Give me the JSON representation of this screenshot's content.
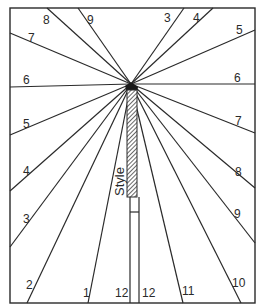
{
  "diagram": {
    "type": "vertical sundial dial face",
    "style_label": "Style",
    "colors": {
      "line": "#2a2a2a",
      "background": "#ffffff"
    },
    "apex": [
      131,
      84
    ],
    "frame": {
      "x": 10,
      "y": 8,
      "w": 245,
      "h": 295
    },
    "hour_lines": [
      {
        "hour": "8",
        "end": [
          47,
          8
        ],
        "label_pos": [
          43,
          24
        ]
      },
      {
        "hour": "9",
        "end": [
          78,
          8
        ],
        "label_pos": [
          87,
          24
        ]
      },
      {
        "hour": "3",
        "end": [
          184,
          8
        ],
        "label_pos": [
          164,
          22
        ]
      },
      {
        "hour": "4",
        "end": [
          213,
          8
        ],
        "label_pos": [
          193,
          22
        ]
      },
      {
        "hour": "7",
        "end": [
          10,
          33
        ],
        "label_pos": [
          28,
          42
        ]
      },
      {
        "hour": "5",
        "end": [
          255,
          30
        ],
        "label_pos": [
          236,
          34
        ]
      },
      {
        "hour": "6",
        "end": [
          10,
          87
        ],
        "label_pos": [
          23,
          84
        ]
      },
      {
        "hour": "6",
        "end": [
          255,
          84
        ],
        "label_pos": [
          234,
          82
        ]
      },
      {
        "hour": "5",
        "end": [
          10,
          135
        ],
        "label_pos": [
          23,
          128
        ]
      },
      {
        "hour": "7",
        "end": [
          255,
          133
        ],
        "label_pos": [
          235,
          125
        ]
      },
      {
        "hour": "4",
        "end": [
          10,
          191
        ],
        "label_pos": [
          23,
          175
        ]
      },
      {
        "hour": "8",
        "end": [
          255,
          188
        ],
        "label_pos": [
          235,
          176
        ]
      },
      {
        "hour": "3",
        "end": [
          10,
          247
        ],
        "label_pos": [
          23,
          223
        ]
      },
      {
        "hour": "9",
        "end": [
          255,
          243
        ],
        "label_pos": [
          234,
          218
        ]
      },
      {
        "hour": "2",
        "end": [
          27,
          303
        ],
        "label_pos": [
          26,
          289
        ]
      },
      {
        "hour": "10",
        "end": [
          241,
          303
        ],
        "label_pos": [
          232,
          287
        ]
      },
      {
        "hour": "1",
        "end": [
          88,
          303
        ],
        "label_pos": [
          83,
          297
        ]
      },
      {
        "hour": "11",
        "end": [
          183,
          303
        ],
        "label_pos": [
          182,
          295
        ]
      },
      {
        "hour": "12",
        "end": [
          130,
          303
        ],
        "label_pos": [
          115,
          297
        ]
      },
      {
        "hour": "12",
        "end": [
          139,
          303
        ],
        "label_pos": [
          142,
          297
        ]
      }
    ]
  }
}
